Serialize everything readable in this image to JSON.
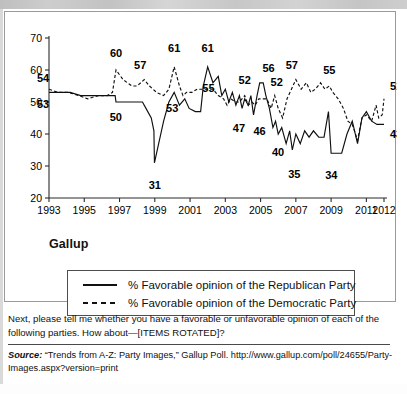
{
  "panel": {
    "source_label": "Gallup",
    "legend": [
      {
        "style": "solid",
        "label": "% Favorable opinion of the Republican Party"
      },
      {
        "style": "dashed",
        "label": "% Favorable opinion of the Democratic Party"
      }
    ]
  },
  "question": "Next, please tell me whether you have a favorable or unfavorable opinion of each of the following parties. How about—[ITEMS ROTATED]?",
  "source": {
    "prefix": "Source:",
    "text": " “Trends from A-Z: Party Images,” Gallup Poll. http://www.gallup.com/poll/24655/Party-Images.aspx?version=print"
  },
  "chart_data": {
    "type": "line",
    "title": "",
    "xlabel": "",
    "ylabel": "",
    "ylim": [
      20,
      70
    ],
    "xlim": [
      1993,
      2012
    ],
    "yticks": [
      20,
      30,
      40,
      50,
      60,
      70
    ],
    "xticks": [
      1993,
      1995,
      1997,
      1999,
      2001,
      2003,
      2005,
      2007,
      2009,
      2011,
      2012
    ],
    "grid": false,
    "legend_position": "below-plot",
    "annotations": [
      {
        "text": "54",
        "series": "Democratic Party",
        "x": 1993,
        "y": 54
      },
      {
        "text": "53",
        "series": "Republican Party",
        "x": 1993,
        "y": 53
      },
      {
        "text": "60",
        "series": "Democratic Party",
        "x": 1996.8,
        "y": 60
      },
      {
        "text": "50",
        "series": "Republican Party",
        "x": 1996.9,
        "y": 50
      },
      {
        "text": "57",
        "series": "Democratic Party",
        "x": 1998.4,
        "y": 57
      },
      {
        "text": "31",
        "series": "Republican Party",
        "x": 1999.0,
        "y": 31
      },
      {
        "text": "61",
        "series": "Democratic Party",
        "x": 2000.1,
        "y": 61
      },
      {
        "text": "53",
        "series": "Republican Party",
        "x": 2000.1,
        "y": 53
      },
      {
        "text": "61",
        "series": "Republican Party",
        "x": 2002.0,
        "y": 61
      },
      {
        "text": "55",
        "series": "Republican Party",
        "x": 2001.7,
        "y": 55
      },
      {
        "text": "52",
        "series": "Democratic Party",
        "x": 2004.1,
        "y": 52
      },
      {
        "text": "47",
        "series": "Republican Party",
        "x": 2004.0,
        "y": 47
      },
      {
        "text": "46",
        "series": "Republican Party",
        "x": 2004.6,
        "y": 46
      },
      {
        "text": "56",
        "series": "Republican Party",
        "x": 2005.0,
        "y": 56
      },
      {
        "text": "52",
        "series": "Democratic Party",
        "x": 2005.8,
        "y": 52
      },
      {
        "text": "40",
        "series": "Republican Party",
        "x": 2006.1,
        "y": 40
      },
      {
        "text": "35",
        "series": "Republican Party",
        "x": 2006.8,
        "y": 35
      },
      {
        "text": "57",
        "series": "Democratic Party",
        "x": 2007.0,
        "y": 57
      },
      {
        "text": "34",
        "series": "Republican Party",
        "x": 2008.9,
        "y": 34
      },
      {
        "text": "55",
        "series": "Democratic Party",
        "x": 2008.9,
        "y": 55
      },
      {
        "text": "51",
        "series": "Democratic Party",
        "x": 2012.0,
        "y": 51
      },
      {
        "text": "43",
        "series": "Republican Party",
        "x": 2012.0,
        "y": 43
      }
    ],
    "series": [
      {
        "name": "Republican Party",
        "style": "solid",
        "points": [
          [
            1993.0,
            53
          ],
          [
            1993.6,
            53
          ],
          [
            1994.2,
            53
          ],
          [
            1994.8,
            52
          ],
          [
            1995.4,
            52
          ],
          [
            1996.0,
            52
          ],
          [
            1996.5,
            52
          ],
          [
            1996.75,
            52
          ],
          [
            1996.8,
            50
          ],
          [
            1997.6,
            50
          ],
          [
            1998.3,
            50
          ],
          [
            1998.5,
            48
          ],
          [
            1998.8,
            45
          ],
          [
            1998.95,
            41
          ],
          [
            1998.98,
            31
          ],
          [
            1999.5,
            44
          ],
          [
            1999.8,
            50
          ],
          [
            2000.1,
            53
          ],
          [
            2000.4,
            49
          ],
          [
            2000.7,
            51
          ],
          [
            2000.95,
            48
          ],
          [
            2001.3,
            47
          ],
          [
            2001.6,
            47
          ],
          [
            2001.75,
            55
          ],
          [
            2002.0,
            61
          ],
          [
            2002.3,
            56
          ],
          [
            2002.6,
            58
          ],
          [
            2002.8,
            52
          ],
          [
            2003.0,
            54
          ],
          [
            2003.2,
            50
          ],
          [
            2003.4,
            53
          ],
          [
            2003.6,
            49
          ],
          [
            2003.8,
            52
          ],
          [
            2003.95,
            48
          ],
          [
            2004.1,
            51
          ],
          [
            2004.3,
            49
          ],
          [
            2004.45,
            52
          ],
          [
            2004.6,
            46
          ],
          [
            2004.8,
            52
          ],
          [
            2004.95,
            56
          ],
          [
            2005.15,
            56
          ],
          [
            2005.3,
            52
          ],
          [
            2005.5,
            48
          ],
          [
            2005.7,
            42
          ],
          [
            2005.85,
            44
          ],
          [
            2006.0,
            40
          ],
          [
            2006.2,
            42
          ],
          [
            2006.45,
            37
          ],
          [
            2006.65,
            41
          ],
          [
            2006.8,
            35
          ],
          [
            2007.0,
            40
          ],
          [
            2007.25,
            37
          ],
          [
            2007.5,
            41
          ],
          [
            2007.75,
            39
          ],
          [
            2008.0,
            41
          ],
          [
            2008.3,
            39
          ],
          [
            2008.6,
            39
          ],
          [
            2008.85,
            47
          ],
          [
            2009.0,
            34
          ],
          [
            2009.3,
            34
          ],
          [
            2009.6,
            34
          ],
          [
            2009.9,
            40
          ],
          [
            2010.2,
            44
          ],
          [
            2010.5,
            37
          ],
          [
            2010.75,
            45
          ],
          [
            2011.0,
            47
          ],
          [
            2011.3,
            44
          ],
          [
            2011.6,
            43
          ],
          [
            2011.8,
            43
          ],
          [
            2012.0,
            43
          ]
        ]
      },
      {
        "name": "Democratic Party",
        "style": "dashed",
        "points": [
          [
            1993.0,
            54
          ],
          [
            1993.5,
            53
          ],
          [
            1994.1,
            53
          ],
          [
            1994.7,
            52
          ],
          [
            1995.2,
            51
          ],
          [
            1995.8,
            52
          ],
          [
            1996.3,
            52
          ],
          [
            1996.6,
            53
          ],
          [
            1996.8,
            60
          ],
          [
            1997.2,
            57
          ],
          [
            1997.7,
            55
          ],
          [
            1998.0,
            55
          ],
          [
            1998.4,
            57
          ],
          [
            1998.7,
            55
          ],
          [
            1999.1,
            53
          ],
          [
            1999.5,
            52
          ],
          [
            1999.8,
            54
          ],
          [
            2000.1,
            61
          ],
          [
            2000.4,
            55
          ],
          [
            2000.6,
            52
          ],
          [
            2000.8,
            53
          ],
          [
            2001.1,
            53
          ],
          [
            2001.4,
            54
          ],
          [
            2001.7,
            54
          ],
          [
            2002.0,
            54
          ],
          [
            2002.3,
            54
          ],
          [
            2002.6,
            52
          ],
          [
            2002.9,
            51
          ],
          [
            2003.1,
            49
          ],
          [
            2003.3,
            51
          ],
          [
            2003.6,
            50
          ],
          [
            2003.8,
            50
          ],
          [
            2004.1,
            52
          ],
          [
            2004.3,
            49
          ],
          [
            2004.5,
            50
          ],
          [
            2004.7,
            49
          ],
          [
            2004.9,
            51
          ],
          [
            2005.1,
            51
          ],
          [
            2005.35,
            51
          ],
          [
            2005.6,
            48
          ],
          [
            2005.8,
            52
          ],
          [
            2006.0,
            48
          ],
          [
            2006.25,
            45
          ],
          [
            2006.5,
            51
          ],
          [
            2006.75,
            54
          ],
          [
            2007.0,
            57
          ],
          [
            2007.3,
            54
          ],
          [
            2007.6,
            56
          ],
          [
            2007.85,
            53
          ],
          [
            2008.1,
            54
          ],
          [
            2008.4,
            56
          ],
          [
            2008.65,
            54
          ],
          [
            2008.9,
            55
          ],
          [
            2009.1,
            53
          ],
          [
            2009.4,
            51
          ],
          [
            2009.7,
            48
          ],
          [
            2009.95,
            44
          ],
          [
            2010.2,
            43
          ],
          [
            2010.5,
            38
          ],
          [
            2010.75,
            45
          ],
          [
            2011.0,
            46
          ],
          [
            2011.3,
            44
          ],
          [
            2011.55,
            49
          ],
          [
            2011.7,
            45
          ],
          [
            2011.9,
            46
          ],
          [
            2012.0,
            51
          ]
        ]
      }
    ]
  }
}
